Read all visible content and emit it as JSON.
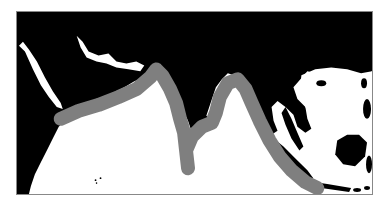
{
  "map": {
    "region": "Indian Ocean, South Asia and Southeast Asia",
    "colors": {
      "land": "#000000",
      "water": "#ffffff",
      "range_band": "#7f7f7f",
      "frame": "#888888"
    },
    "layers": [
      {
        "name": "land",
        "label": ""
      },
      {
        "name": "distribution-range",
        "label": ""
      }
    ]
  }
}
